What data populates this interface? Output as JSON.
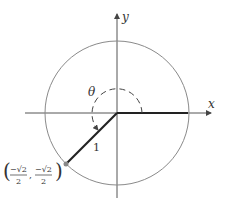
{
  "diagram": {
    "axes": {
      "x_label": "x",
      "y_label": "y"
    },
    "angle_label": "θ",
    "radius_label": "1",
    "point": {
      "x_num": "−√2",
      "x_den": "2",
      "y_num": "−√2",
      "y_den": "2",
      "x": -0.7071,
      "y": -0.7071
    },
    "colors": {
      "circle": "#8a8a8a",
      "axes": "#555555",
      "terminal": "#222222",
      "point": "#888888"
    }
  }
}
